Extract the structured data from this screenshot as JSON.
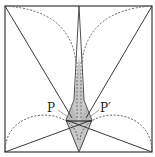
{
  "figure": {
    "labels": [
      {
        "id": "P",
        "text": "P",
        "x": 47,
        "y": 112
      },
      {
        "id": "P-prime",
        "text": "P′",
        "x": 100,
        "y": 112
      }
    ],
    "colors": {
      "stroke": "#3a3a3a",
      "dashed": "#555555",
      "fill": "#c8c8c8",
      "background": "#ffffff"
    },
    "square": {
      "x": 5,
      "y": 6,
      "w": 147,
      "h": 146
    }
  }
}
